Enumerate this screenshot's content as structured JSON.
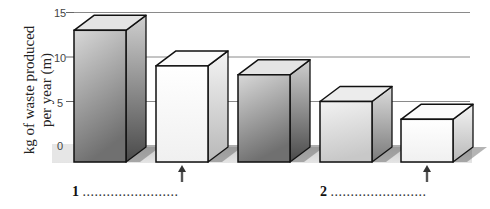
{
  "chart_data": {
    "type": "bar",
    "style": "3d-box",
    "title": "",
    "xlabel": "",
    "ylabel": "kg of waste produced per year (m)",
    "ylabel_lines": [
      "kg of waste produced",
      "per year (m)"
    ],
    "yticks": [
      "0",
      "5",
      "10",
      "15"
    ],
    "ylim": [
      0,
      15
    ],
    "grid": true,
    "categories": [
      "",
      "",
      "",
      "",
      ""
    ],
    "values": [
      13,
      9,
      8,
      5,
      3
    ],
    "bar_shading": [
      "dark",
      "white",
      "dark",
      "light",
      "white"
    ],
    "arrows_under_bars": [
      2,
      5
    ],
    "annotations": [
      {
        "label": "1",
        "blank": "........................",
        "position": "below bar 2"
      },
      {
        "label": "2",
        "blank": "........................",
        "position": "below bar 5"
      }
    ]
  }
}
